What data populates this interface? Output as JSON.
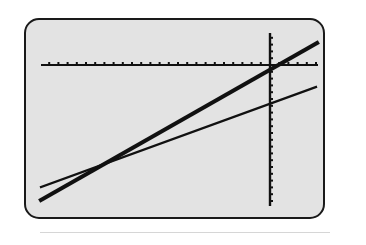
{
  "screen": {
    "background": "#e3e3e3",
    "border_color": "#1a1a1a"
  },
  "chart_data": {
    "type": "line",
    "title": "",
    "xlabel": "",
    "ylabel": "",
    "grid": false,
    "legend": "none",
    "axes": {
      "x_axis_pixel_y": 65,
      "y_axis_pixel_x": 270,
      "x_axis_range_px": [
        41,
        318
      ],
      "y_axis_range_px": [
        33,
        206
      ],
      "x_tick_spacing_px": 9.2,
      "y_tick_spacing_px": 6.8
    },
    "series": [
      {
        "name": "line-1-thick",
        "style": "thick",
        "color": "#111111",
        "points_px": [
          [
            41,
            200
          ],
          [
            317,
            43
          ]
        ]
      },
      {
        "name": "line-2-thin",
        "style": "thin",
        "color": "#111111",
        "points_px": [
          [
            41,
            187
          ],
          [
            316,
            87
          ]
        ]
      }
    ],
    "annotations": [
      {
        "type": "intersection",
        "description": "thick line crosses axes origin region",
        "px": [
          270,
          68
        ]
      },
      {
        "type": "intersection",
        "description": "thick and thin lines cross",
        "px": [
          110,
          161
        ]
      }
    ]
  }
}
